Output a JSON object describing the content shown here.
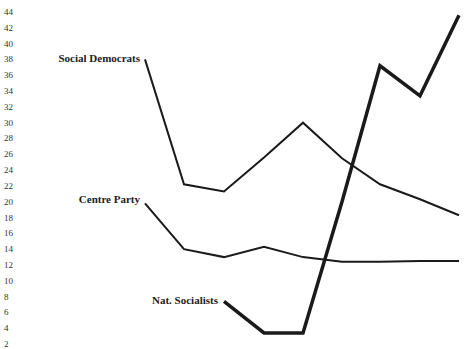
{
  "chart_data": {
    "type": "line",
    "title": "",
    "xlabel": "",
    "ylabel": "",
    "ylim": [
      2,
      44
    ],
    "yticks": [
      44,
      42,
      40,
      38,
      36,
      34,
      32,
      30,
      28,
      26,
      24,
      22,
      20,
      18,
      16,
      14,
      12,
      10,
      8,
      6,
      4,
      2
    ],
    "grid": false,
    "legend": "inline labels",
    "x_index": [
      0,
      1,
      2,
      3,
      4,
      5,
      6,
      7,
      8
    ],
    "series": [
      {
        "name": "Social Democrats",
        "values": [
          38,
          22.2,
          21.3,
          25.6,
          30,
          25.5,
          22.2,
          20.3,
          18.3
        ],
        "stroke": 2
      },
      {
        "name": "Centre Party",
        "values": [
          19.8,
          14,
          13,
          14.3,
          13,
          12.4,
          12.4,
          12.5,
          12.5
        ],
        "stroke": 2
      },
      {
        "name": "Nat. Socialists",
        "values": [
          null,
          null,
          7.4,
          3.4,
          3.4,
          20,
          37.2,
          33.4,
          43.6
        ],
        "stroke": 3.5
      }
    ]
  }
}
